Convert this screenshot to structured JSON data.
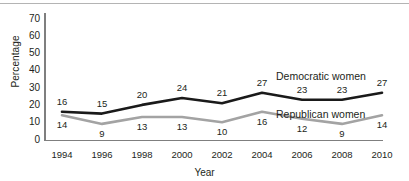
{
  "chart_data": {
    "type": "line",
    "title": "",
    "xlabel": "Year",
    "ylabel": "Percentage",
    "categories": [
      "1994",
      "1996",
      "1998",
      "2000",
      "2002",
      "2004",
      "2006",
      "2008",
      "2010"
    ],
    "x": [
      1994,
      1996,
      1998,
      2000,
      2002,
      2004,
      2006,
      2008,
      2010
    ],
    "ylim": [
      0,
      70
    ],
    "y_ticks": [
      "0",
      "10",
      "20",
      "30",
      "40",
      "50",
      "60",
      "70"
    ],
    "grid": false,
    "legend_position": "inline-right",
    "series": [
      {
        "name": "Democratic women",
        "color": "#1a1a1a",
        "values": [
          16,
          15,
          20,
          24,
          21,
          27,
          23,
          23,
          27
        ],
        "labels": [
          "16",
          "15",
          "20",
          "24",
          "21",
          "27",
          "23",
          "23",
          "27"
        ]
      },
      {
        "name": "Republican women",
        "color": "#a3a3a3",
        "values": [
          14,
          9,
          13,
          13,
          10,
          16,
          12,
          9,
          14
        ],
        "labels": [
          "14",
          "9",
          "13",
          "13",
          "10",
          "16",
          "12",
          "9",
          "14"
        ]
      }
    ]
  },
  "axes": {
    "y_title": "Percentage",
    "x_title": "Year",
    "axis_color": "#7f7f7f"
  }
}
